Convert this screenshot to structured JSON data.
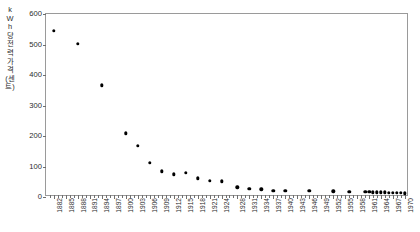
{
  "chart_data": {
    "type": "scatter",
    "title": "",
    "xlabel": "",
    "ylabel": "kWh당 전력 가격(센트)",
    "ylabel_chars": [
      "k",
      "W",
      "h",
      "당",
      "전",
      "력",
      "가",
      "격",
      "(센",
      "트)"
    ],
    "xlim": [
      1880,
      1971
    ],
    "ylim": [
      0,
      600
    ],
    "y_ticks": [
      0,
      100,
      200,
      300,
      400,
      500,
      600
    ],
    "y_tick_labels": [
      "0",
      "100",
      "200",
      "300",
      "400",
      "500",
      "600"
    ],
    "x_tick_labels": [
      "1882",
      "1885",
      "1888",
      "1891",
      "1894",
      "1897",
      "1900",
      "1903",
      "1906",
      "1909",
      "1912",
      "1915",
      "1918",
      "1921",
      "1924",
      "1928",
      "1931",
      "1934",
      "1937",
      "1940",
      "1943",
      "1946",
      "1949",
      "1952",
      "1955",
      "1958",
      "1961",
      "1964",
      "1967",
      "1970"
    ],
    "x_tick_values": [
      1882,
      1885,
      1888,
      1891,
      1894,
      1897,
      1900,
      1903,
      1906,
      1909,
      1912,
      1915,
      1918,
      1921,
      1924,
      1928,
      1931,
      1934,
      1937,
      1940,
      1943,
      1946,
      1949,
      1952,
      1955,
      1958,
      1961,
      1964,
      1967,
      1970
    ],
    "grid": false,
    "legend": false,
    "marker": "filled-circle",
    "marker_color": "#000000",
    "series": [
      {
        "name": "전력 가격",
        "x": [
          1882,
          1888,
          1894,
          1900,
          1903,
          1906,
          1909,
          1912,
          1915,
          1918,
          1921,
          1924,
          1928,
          1931,
          1934,
          1937,
          1940,
          1946,
          1952,
          1956,
          1960,
          1961,
          1962,
          1963,
          1964,
          1965,
          1966,
          1967,
          1968,
          1969,
          1970
        ],
        "y": [
          545,
          502,
          366,
          209,
          168,
          112,
          84,
          74,
          79,
          61,
          53,
          51,
          32,
          26,
          25,
          20,
          20,
          20,
          19,
          18,
          17,
          17,
          16,
          16,
          15,
          15,
          14,
          14,
          13,
          13,
          12
        ]
      }
    ]
  }
}
